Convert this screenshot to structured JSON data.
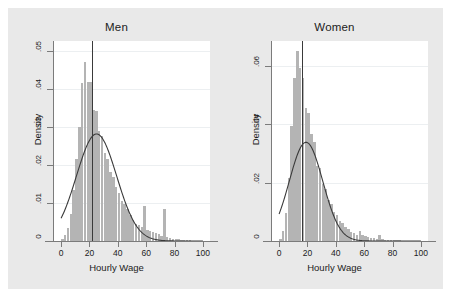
{
  "figure": {
    "background_color": "#e9e9e9",
    "plot_background_color": "#ffffff",
    "bar_color": "#b4b4b4",
    "curve_color": "#3a3a3a",
    "axis_color": "#7b7b7b"
  },
  "chart_data": [
    {
      "type": "bar",
      "title": "Men",
      "xlabel": "Hourly Wage",
      "ylabel": "Density",
      "xlim": [
        -5,
        105
      ],
      "ylim": [
        0,
        0.0525
      ],
      "xticks": [
        0,
        20,
        40,
        60,
        80,
        100
      ],
      "xtick_labels": [
        "0",
        "20",
        "40",
        "60",
        "80",
        "100"
      ],
      "yticks": [
        0,
        0.01,
        0.02,
        0.03,
        0.04,
        0.05
      ],
      "ytick_labels": [
        "0",
        ".01",
        ".02",
        ".03",
        ".04",
        ".05"
      ],
      "grid": true,
      "bin_width": 2,
      "bin_centers": [
        1,
        3,
        5,
        7,
        9,
        11,
        13,
        15,
        17,
        19,
        21,
        23,
        25,
        27,
        29,
        31,
        33,
        35,
        37,
        39,
        41,
        43,
        45,
        47,
        49,
        51,
        53,
        55,
        57,
        59,
        61,
        63,
        65,
        67,
        69,
        71,
        73,
        75,
        77,
        79,
        81,
        83,
        85,
        87,
        89,
        91,
        93,
        95,
        97,
        99
      ],
      "values": [
        0.0005,
        0.0016,
        0.0035,
        0.0072,
        0.0135,
        0.0215,
        0.03,
        0.0415,
        0.047,
        0.0418,
        0.0418,
        0.0345,
        0.034,
        0.0288,
        0.0275,
        0.0231,
        0.0215,
        0.0182,
        0.0168,
        0.0141,
        0.0127,
        0.0105,
        0.0098,
        0.0083,
        0.0068,
        0.0055,
        0.0045,
        0.0041,
        0.0038,
        0.0092,
        0.003,
        0.0027,
        0.0024,
        0.002,
        0.0018,
        0.0014,
        0.0085,
        0.001,
        0.0008,
        0.0006,
        0.0005,
        0.0004,
        0.0003,
        0.0003,
        0.0002,
        0.0002,
        0.0001,
        0.0001,
        0.0001,
        0.0001
      ],
      "overlay_curve": {
        "name": "normal-density",
        "mean": 25.0,
        "sd": 14.2,
        "peak_value": 0.0281
      },
      "reference_line": {
        "name": "mean-wage-line",
        "x": 22.0
      }
    },
    {
      "type": "bar",
      "title": "Women",
      "xlabel": "Hourly Wage",
      "ylabel": "Density",
      "xlim": [
        -5,
        105
      ],
      "ylim": [
        0,
        0.0685
      ],
      "xticks": [
        0,
        20,
        40,
        60,
        80,
        100
      ],
      "xtick_labels": [
        "0",
        "20",
        "40",
        "60",
        "80",
        "100"
      ],
      "yticks": [
        0,
        0.02,
        0.04,
        0.06
      ],
      "ytick_labels": [
        "0",
        ".02",
        ".04",
        ".06"
      ],
      "grid": true,
      "bin_width": 2,
      "bin_centers": [
        1,
        3,
        5,
        7,
        9,
        11,
        13,
        15,
        17,
        19,
        21,
        23,
        25,
        27,
        29,
        31,
        33,
        35,
        37,
        39,
        41,
        43,
        45,
        47,
        49,
        51,
        53,
        55,
        57,
        59,
        61,
        63,
        65,
        67,
        69,
        71,
        73,
        75,
        77,
        79,
        81,
        83,
        85,
        87,
        89,
        91,
        93,
        95,
        97,
        99
      ],
      "values": [
        0.0008,
        0.0035,
        0.0095,
        0.0215,
        0.0395,
        0.056,
        0.065,
        0.0592,
        0.056,
        0.0455,
        0.0438,
        0.0368,
        0.034,
        0.0258,
        0.025,
        0.0195,
        0.0178,
        0.014,
        0.0128,
        0.01,
        0.0088,
        0.0068,
        0.006,
        0.0047,
        0.0041,
        0.0032,
        0.0028,
        0.0022,
        0.0036,
        0.0021,
        0.0018,
        0.0014,
        0.0012,
        0.001,
        0.0008,
        0.0022,
        0.0006,
        0.0005,
        0.0004,
        0.0003,
        0.0003,
        0.0002,
        0.0002,
        0.0001,
        0.0001,
        0.0001,
        0.0001,
        0.0001,
        0.0,
        0.0
      ],
      "overlay_curve": {
        "name": "normal-density",
        "mean": 19.0,
        "sd": 11.8,
        "peak_value": 0.0338
      },
      "reference_line": {
        "name": "mean-wage-line",
        "x": 16.0
      }
    }
  ]
}
